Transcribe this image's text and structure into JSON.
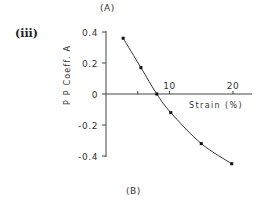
{
  "figure": {
    "top_label": "(A)",
    "bottom_label": "(B)",
    "panel_label": "(iii)"
  },
  "chart_data": {
    "type": "line",
    "title": "",
    "xlabel": "Strain (%)",
    "ylabel": "P P Coeff. A",
    "x": [
      2.7,
      5.5,
      8.0,
      10.2,
      15.0,
      19.8
    ],
    "values": [
      0.36,
      0.17,
      0.0,
      -0.12,
      -0.32,
      -0.45
    ],
    "series": [
      {
        "name": "PP Coeff. A",
        "x": [
          2.7,
          5.5,
          8.0,
          10.2,
          15.0,
          19.8
        ],
        "values": [
          0.36,
          0.17,
          0.0,
          -0.12,
          -0.32,
          -0.45
        ]
      }
    ],
    "xticks": [
      {
        "value": 5,
        "label": ""
      },
      {
        "value": 10,
        "label": "10"
      },
      {
        "value": 20,
        "label": "20"
      }
    ],
    "yticks": [
      {
        "value": 0.4,
        "label": "0.4"
      },
      {
        "value": 0.2,
        "label": "0.2"
      },
      {
        "value": 0,
        "label": "0"
      },
      {
        "value": -0.2,
        "label": "-0.2"
      },
      {
        "value": -0.4,
        "label": "-0.4"
      }
    ],
    "xlim": [
      0,
      23
    ],
    "ylim": [
      -0.4,
      0.4
    ],
    "grid": false,
    "legend": "none",
    "markers": true,
    "colors": {
      "line": "#333333",
      "marker": "#111111",
      "axis": "#444444"
    }
  }
}
